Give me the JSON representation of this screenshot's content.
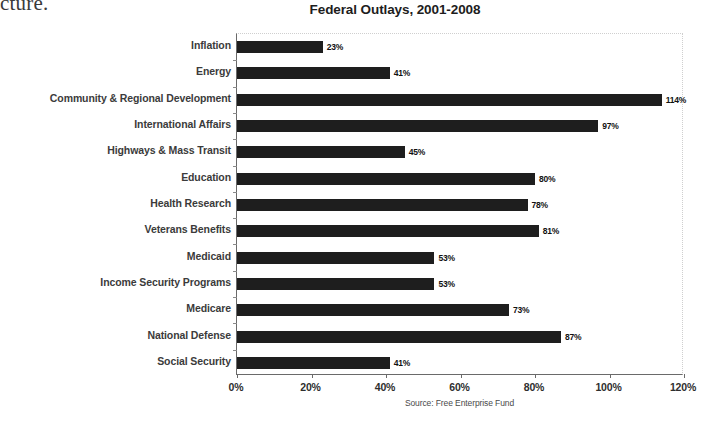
{
  "page_fragment": "cture.",
  "source_note": "Source: Free Enterprise Fund",
  "chart_data": {
    "type": "bar",
    "orientation": "horizontal",
    "title": "Federal Outlays, 2001-2008",
    "xlabel": "",
    "ylabel": "",
    "xlim": [
      0,
      120
    ],
    "xticks": [
      0,
      20,
      40,
      60,
      80,
      100,
      120
    ],
    "xticklabels": [
      "0%",
      "20%",
      "40%",
      "60%",
      "80%",
      "100%",
      "120%"
    ],
    "grid": false,
    "legend": null,
    "bar_color": "#1e1e1e",
    "value_suffix": "%",
    "categories": [
      "Inflation",
      "Energy",
      "Community & Regional Development",
      "International Affairs",
      "Highways & Mass Transit",
      "Education",
      "Health Research",
      "Veterans Benefits",
      "Medicaid",
      "Income Security Programs",
      "Medicare",
      "National Defense",
      "Social Security"
    ],
    "values": [
      23,
      41,
      114,
      97,
      45,
      80,
      78,
      81,
      53,
      53,
      73,
      87,
      41
    ],
    "value_labels": [
      "23%",
      "41%",
      "114%",
      "97%",
      "45%",
      "80%",
      "78%",
      "81%",
      "53%",
      "53%",
      "73%",
      "87%",
      "41%"
    ]
  }
}
